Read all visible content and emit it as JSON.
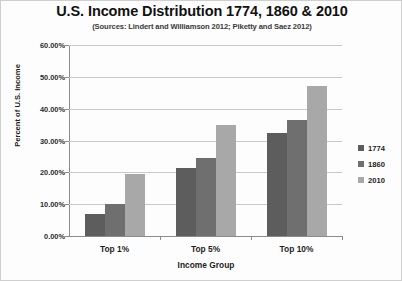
{
  "chart_data": {
    "type": "bar",
    "title": "U.S. Income Distribution 1774, 1860 & 2010",
    "subtitle": "(Sources: Lindert and Williamson 2012; Piketty and Saez 2012)",
    "xlabel": "Income Group",
    "ylabel": "Percent of U.S. Income",
    "categories": [
      "Top 1%",
      "Top 5%",
      "Top 10%"
    ],
    "series": [
      {
        "name": "1774",
        "values": [
          7.0,
          21.5,
          32.5
        ],
        "color": "#5d5d5d"
      },
      {
        "name": "1860",
        "values": [
          10.0,
          24.5,
          36.5
        ],
        "color": "#6f6f6f"
      },
      {
        "name": "2010",
        "values": [
          19.5,
          35.0,
          47.0
        ],
        "color": "#a8a8a8"
      }
    ],
    "ylim": [
      0,
      60
    ],
    "ytick_labels": [
      "60.00%",
      "50.00%",
      "40.00%",
      "30.00%",
      "20.00%",
      "10.00%",
      "0.00%"
    ],
    "ytick_values": [
      60,
      50,
      40,
      30,
      20,
      10,
      0
    ],
    "grid": true,
    "legend_position": "right"
  }
}
